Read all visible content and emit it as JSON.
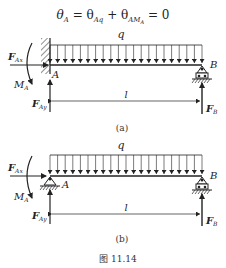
{
  "equation": {
    "lhs": "θ",
    "lhs_sub": "A",
    "eq1": " = θ",
    "term1_sub": "Aq",
    "plus": " + θ",
    "term2_sub": "AM",
    "term2_subsub": "A",
    "rhs": " = 0"
  },
  "diagram_a": {
    "load_label": "q",
    "support_left": "fixed wall",
    "support_right": "roller",
    "labels": {
      "FAx": "F",
      "FAx_sub": "Ax",
      "MA": "M",
      "MA_sub": "A",
      "A": "A",
      "B": "B",
      "FAy": "F",
      "FAy_sub": "Ay",
      "FB": "F",
      "FB_sub": "B",
      "length": "l"
    },
    "caption": "(a)"
  },
  "diagram_b": {
    "load_label": "q",
    "support_left": "pin",
    "support_right": "roller",
    "labels": {
      "FAx": "F",
      "FAx_sub": "Ax",
      "MA": "M",
      "MA_sub": "A",
      "A": "A",
      "B": "B",
      "FAy": "F",
      "FAy_sub": "Ay",
      "FB": "F",
      "FB_sub": "B",
      "length": "l"
    },
    "caption": "(b)"
  },
  "figure_caption": "图 11.14"
}
